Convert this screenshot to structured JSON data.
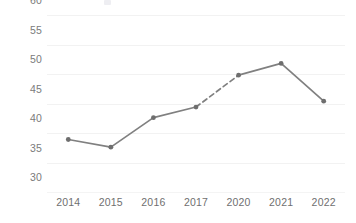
{
  "chart_data": {
    "type": "line",
    "title": "",
    "subtitle": "",
    "xlabel": "",
    "ylabel": "% Agreeing",
    "categories": [
      "2014",
      "2015",
      "2016",
      "2017",
      "2020",
      "2021",
      "2022"
    ],
    "values": [
      38.9,
      37.6,
      42.6,
      44.4,
      49.8,
      51.8,
      45.4
    ],
    "series": [
      {
        "name": "% Agreeing",
        "values": [
          38.9,
          37.6,
          42.6,
          44.4,
          49.8,
          51.8,
          45.4
        ]
      }
    ],
    "ylim": [
      30,
      60
    ],
    "yticks": [
      30,
      35,
      40,
      45,
      50,
      55,
      60
    ],
    "ytick_labels": [
      "30",
      "35",
      "40",
      "45",
      "50",
      "55",
      "60"
    ],
    "grid": "horizontal",
    "legend": "none",
    "annotations": [
      {
        "type": "dashed-segment",
        "from": "2017",
        "to": "2020",
        "note": "gap in data between 2017 and 2020"
      }
    ],
    "colors": {
      "line": "#808080",
      "marker": "#6e6e6e",
      "grid": "#f2f2f2",
      "tick_text": "#7b7b7b",
      "axis_title": "#5a5a5a",
      "background": "#ffffff"
    }
  }
}
